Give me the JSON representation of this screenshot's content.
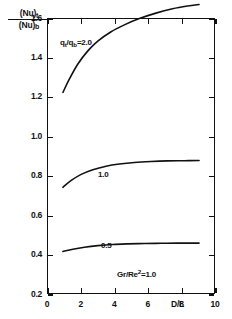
{
  "chart_data": {
    "type": "line",
    "title": "",
    "xlabel": "D/L",
    "ylabel": "(Nu)t/(Nu)b",
    "ylabel_numerator": "(Nu)",
    "ylabel_numerator_sub": "t",
    "ylabel_denominator": "(Nu)",
    "ylabel_denominator_sub": "b",
    "xlim": [
      0,
      10
    ],
    "ylim": [
      0.2,
      1.6
    ],
    "xticks": [
      0,
      2,
      4,
      6,
      8,
      10
    ],
    "xtick_labels": [
      "0",
      "2",
      "4",
      "6",
      "8",
      "10"
    ],
    "yticks": [
      0.2,
      0.4,
      0.6,
      0.8,
      1.0,
      1.2,
      1.4,
      1.6
    ],
    "ytick_labels": [
      "0.2",
      "0.4",
      "0.6",
      "0.8",
      "1.0",
      "1.2",
      "1.4",
      "1.6"
    ],
    "grid": false,
    "legend_position": "inline-curve-labels",
    "series": [
      {
        "name": "2.0",
        "label": "2.0",
        "x": [
          0.9,
          1.3,
          1.8,
          2.4,
          3.0,
          3.8,
          4.6,
          5.5,
          6.5,
          7.5,
          8.4,
          9.1
        ],
        "y": [
          1.225,
          1.295,
          1.37,
          1.437,
          1.487,
          1.535,
          1.57,
          1.602,
          1.63,
          1.652,
          1.666,
          1.674
        ]
      },
      {
        "name": "1.0",
        "label": "1.0",
        "x": [
          0.9,
          1.4,
          2.0,
          2.7,
          3.5,
          4.3,
          5.2,
          6.2,
          7.2,
          8.2,
          9.1
        ],
        "y": [
          0.74,
          0.775,
          0.806,
          0.83,
          0.848,
          0.859,
          0.867,
          0.872,
          0.875,
          0.876,
          0.877
        ]
      },
      {
        "name": "0.5",
        "label": "0.5",
        "x": [
          0.9,
          1.5,
          2.2,
          3.0,
          3.9,
          4.8,
          5.8,
          6.8,
          7.8,
          9.1
        ],
        "y": [
          0.412,
          0.424,
          0.434,
          0.442,
          0.448,
          0.451,
          0.453,
          0.454,
          0.455,
          0.455
        ]
      }
    ],
    "annotations": [
      {
        "id": "ratio-2",
        "prefix": "q",
        "sub1": "t",
        "mid": "/q",
        "sub2": "b",
        "suffix": "=2.0",
        "text": "qt/qb=2.0"
      },
      {
        "id": "ratio-1",
        "text": "1.0"
      },
      {
        "id": "ratio-0p5",
        "text": "0.5"
      },
      {
        "id": "gr-re",
        "prefix": "Gr/Re",
        "sup": "2",
        "suffix": "=1.0",
        "text": "Gr/Re2=1.0"
      }
    ],
    "colors": {
      "axis": "#111111",
      "curve": "#111111",
      "background": "#ffffff"
    }
  }
}
